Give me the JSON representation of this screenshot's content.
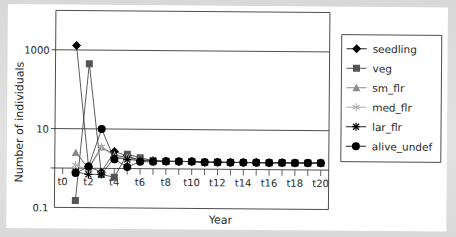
{
  "chart_data": {
    "type": "line",
    "title": "",
    "xlabel": "Year",
    "ylabel": "Number of individuals",
    "yscale": "log",
    "ylim": [
      0.1,
      10000
    ],
    "y_ticks": [
      {
        "value": 0.1,
        "label": "0.1"
      },
      {
        "value": 10,
        "label": "10"
      },
      {
        "value": 1000,
        "label": "1000"
      }
    ],
    "y_gridlines": [
      1,
      10,
      1000
    ],
    "x": [
      "t0",
      "t1",
      "t2",
      "t3",
      "t4",
      "t5",
      "t6",
      "t7",
      "t8",
      "t9",
      "t10",
      "t11",
      "t12",
      "t13",
      "t14",
      "t15",
      "t16",
      "t17",
      "t18",
      "t19",
      "t20"
    ],
    "x_tick_labels": [
      "t0",
      "t2",
      "t4",
      "t6",
      "t8",
      "t10",
      "t12",
      "t14",
      "t16",
      "t18",
      "t20"
    ],
    "grid": true,
    "legend_position": "right",
    "series": [
      {
        "name": "seedling",
        "marker": "diamond",
        "color": "#000000",
        "values": [
          null,
          1300,
          1.1,
          0.8,
          2.7,
          2.1,
          1.6,
          1.6,
          1.55,
          1.55,
          1.55,
          1.5,
          1.5,
          1.5,
          1.5,
          1.5,
          1.5,
          1.5,
          1.5,
          1.5,
          1.5
        ]
      },
      {
        "name": "veg",
        "marker": "square",
        "color": "#555555",
        "values": [
          null,
          0.15,
          450,
          0.7,
          0.6,
          2.3,
          1.9,
          1.6,
          1.55,
          1.55,
          1.55,
          1.5,
          1.5,
          1.5,
          1.5,
          1.5,
          1.5,
          1.5,
          1.5,
          1.5,
          1.5
        ]
      },
      {
        "name": "sm_flr",
        "marker": "triangle",
        "color": "#8a8a8a",
        "values": [
          null,
          2.5,
          1.0,
          3.5,
          2.2,
          1.9,
          1.7,
          1.6,
          1.55,
          1.55,
          1.55,
          1.5,
          1.5,
          1.5,
          1.5,
          1.5,
          1.5,
          1.5,
          1.5,
          1.5,
          1.5
        ]
      },
      {
        "name": "med_flr",
        "marker": "asterisk",
        "color": "#b0b0b0",
        "values": [
          null,
          1.2,
          0.9,
          3.5,
          2.0,
          1.8,
          1.6,
          1.6,
          1.55,
          1.55,
          1.55,
          1.5,
          1.5,
          1.5,
          1.5,
          1.5,
          1.5,
          1.5,
          1.5,
          1.5,
          1.5
        ]
      },
      {
        "name": "lar_flr",
        "marker": "star",
        "color": "#000000",
        "values": [
          null,
          0.8,
          0.7,
          0.7,
          1.9,
          1.7,
          1.6,
          1.6,
          1.55,
          1.55,
          1.55,
          1.5,
          1.5,
          1.5,
          1.5,
          1.5,
          1.5,
          1.5,
          1.5,
          1.5,
          1.5
        ]
      },
      {
        "name": "alive_undef",
        "marker": "circle",
        "color": "#000000",
        "values": [
          null,
          0.75,
          1.1,
          10,
          1.7,
          1.1,
          1.5,
          1.5,
          1.55,
          1.55,
          1.55,
          1.5,
          1.5,
          1.5,
          1.5,
          1.5,
          1.5,
          1.5,
          1.5,
          1.5,
          1.5
        ]
      }
    ]
  },
  "colors": {
    "background": "#d9d9d9",
    "sheet": "#ffffff",
    "gridline": "#3a3a3a",
    "axis": "#3a3a3a",
    "text": "#2a2a2a"
  }
}
